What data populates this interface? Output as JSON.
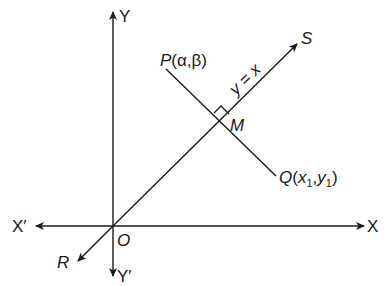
{
  "diagram": {
    "type": "coordinate-geometry",
    "colors": {
      "ink": "#1a1a1a",
      "background": "#ffffff"
    },
    "axes": {
      "x_positive": "X",
      "x_negative": "X′",
      "y_positive": "Y",
      "y_negative": "Y′",
      "origin": "O"
    },
    "line": {
      "equation": "y = x",
      "end_upper": "S",
      "end_lower": "R"
    },
    "points": {
      "P": {
        "name": "P",
        "coords": "(α,β)",
        "open": "(",
        "a": "α",
        "comma": ",",
        "b": "β",
        "close": ")"
      },
      "Q": {
        "name": "Q",
        "open": "(",
        "x": "x",
        "x_sub": "1",
        "comma": ",",
        "y": "y",
        "y_sub": "1",
        "close": ")"
      },
      "M": {
        "name": "M"
      }
    },
    "annotations": {
      "right_angle_at": "M"
    }
  }
}
